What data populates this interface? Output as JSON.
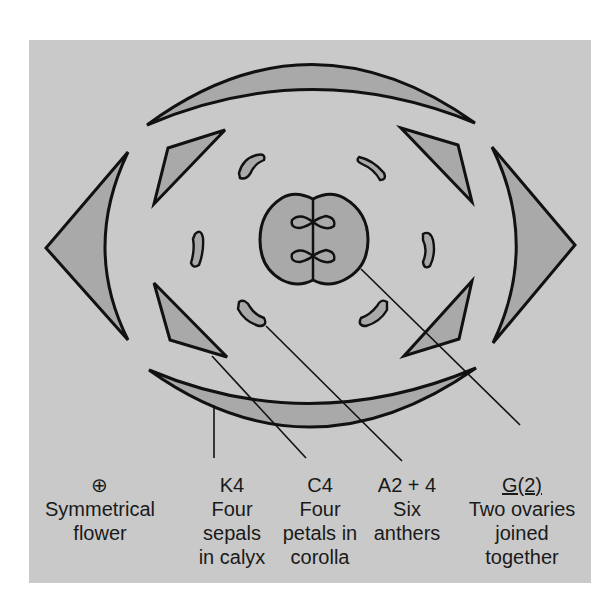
{
  "diagram": {
    "type": "floral-diagram",
    "colors": {
      "background": "#c9c9c9",
      "organ_fill": "#a9a9a9",
      "stroke": "#111111",
      "page": "#ffffff"
    },
    "labels": [
      {
        "formula": "⊕",
        "lines": [
          "Symmetrical",
          "flower"
        ]
      },
      {
        "formula": "K4",
        "lines": [
          "Four",
          "sepals",
          "in calyx"
        ]
      },
      {
        "formula": "C4",
        "lines": [
          "Four",
          "petals in",
          "corolla"
        ]
      },
      {
        "formula": "A2 + 4",
        "lines": [
          "Six",
          "anthers"
        ]
      },
      {
        "formula": "G(2)",
        "lines": [
          "Two ovaries",
          "joined",
          "together"
        ]
      }
    ]
  }
}
